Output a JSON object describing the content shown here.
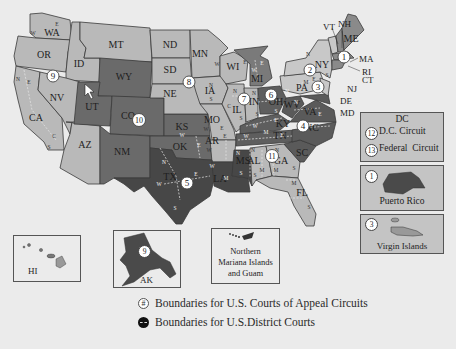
{
  "colors": {
    "background": "#ebebeb",
    "light_gray": "#b9b9b9",
    "mid_gray": "#9a9a9a",
    "dark_gray": "#6a6a6a",
    "darker_gray": "#555555",
    "darkest_gray": "#474747",
    "circle_fill": "#ffffff"
  },
  "states": {
    "WA": "WA",
    "OR": "OR",
    "CA": "CA",
    "ID": "ID",
    "NV": "NV",
    "MT": "MT",
    "WY": "WY",
    "UT": "UT",
    "CO": "CO",
    "AZ": "AZ",
    "NM": "NM",
    "ND": "ND",
    "SD": "SD",
    "NE": "NE",
    "KS": "KS",
    "OK": "OK",
    "TX": "TX",
    "MN": "MN",
    "IA": "IA",
    "MO": "MO",
    "AR": "AR",
    "LA": "LA",
    "WI": "WI",
    "IL": "IL",
    "MI": "MI",
    "IN": "IN",
    "OH": "OH",
    "KY": "KY",
    "TN": "TN",
    "MS": "MS",
    "AL": "AL",
    "GA": "GA",
    "FL": "FL",
    "SC": "SC",
    "NC": "NC",
    "VA": "VA",
    "WV": "WV",
    "PA": "PA",
    "NY": "NY",
    "ME": "ME",
    "NH": "NH",
    "VT": "VT",
    "MA": "MA",
    "RI": "RI",
    "CT": "CT",
    "NJ": "NJ",
    "DE": "DE",
    "MD": "MD"
  },
  "circuits": {
    "c1": "1",
    "c2": "2",
    "c3": "3",
    "c4": "4",
    "c5": "5",
    "c6": "6",
    "c7": "7",
    "c8": "8",
    "c9": "9",
    "c10": "10",
    "c11": "11",
    "c12": "12",
    "c13": "13"
  },
  "districts": {
    "N": "N",
    "S": "S",
    "E": "E",
    "W": "W",
    "C": "C",
    "M": "M"
  },
  "insets": {
    "dc": {
      "title": "DC",
      "items": [
        {
          "num": "12",
          "label": "D.C. Circuit"
        },
        {
          "num": "13",
          "label": "Federal  Circuit"
        }
      ]
    },
    "puerto_rico": {
      "num": "1",
      "label": "Puerto Rico"
    },
    "virgin_islands": {
      "num": "3",
      "label": "Virgin Islands"
    },
    "hawaii": {
      "label": "HI"
    },
    "alaska": {
      "num": "9",
      "label": "AK"
    },
    "mariana": {
      "line1": "Northern",
      "line2": "Mariana Islands",
      "line3": "and Guam"
    }
  },
  "legend": {
    "circuit_symbol": "#",
    "circuit_label": "Boundaries for U.S. Courts of Appeal Circuits",
    "district_label": "Boundaries for U.S.District Courts"
  }
}
